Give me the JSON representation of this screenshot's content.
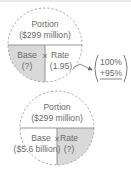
{
  "diagrams": [
    {
      "id": "find-base",
      "portion": {
        "label": "Portion",
        "value": "($299 million)"
      },
      "base": {
        "label": "Base",
        "value": "(?)"
      },
      "rate": {
        "label": "Rate",
        "value": "(1.95)"
      },
      "operator": "×",
      "shaded_cell": "base",
      "callout": {
        "line1": "100%",
        "line2": "+95%"
      }
    },
    {
      "id": "find-rate",
      "portion": {
        "label": "Portion",
        "value": "($299 million)"
      },
      "base": {
        "label": "Base",
        "value": "($5.6 billion)"
      },
      "rate": {
        "label": "Rate",
        "value": "(?)"
      },
      "operator": "×",
      "shaded_cell": "rate"
    }
  ],
  "colors": {
    "shade": "#d9d9d9",
    "line": "#8a8a8a",
    "dash": "#9a9a9a",
    "text": "#6b6b6b"
  }
}
